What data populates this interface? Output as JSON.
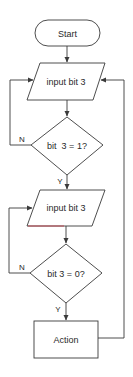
{
  "diagram": {
    "type": "flowchart",
    "colors": {
      "stroke": "#3a3a3a",
      "text": "#2a2a2a",
      "background": "#ffffff",
      "accent_edge": "#c0404a"
    },
    "nodes": {
      "start": {
        "shape": "terminal",
        "label": "Start"
      },
      "input1": {
        "shape": "parallelogram",
        "label": "input bit 3"
      },
      "decision1": {
        "shape": "diamond",
        "label": "bit  3 = 1?"
      },
      "input2": {
        "shape": "parallelogram",
        "label": "input bit 3"
      },
      "decision2": {
        "shape": "diamond",
        "label": "bit 3 = 0?"
      },
      "action": {
        "shape": "rectangle",
        "label": "Action"
      }
    },
    "edges": [
      {
        "from": "start",
        "to": "input1",
        "label": ""
      },
      {
        "from": "input1",
        "to": "decision1",
        "label": ""
      },
      {
        "from": "decision1",
        "to": "input1",
        "label": "N"
      },
      {
        "from": "decision1",
        "to": "input2",
        "label": "Y"
      },
      {
        "from": "input2",
        "to": "decision2",
        "label": ""
      },
      {
        "from": "decision2",
        "to": "input2",
        "label": "N"
      },
      {
        "from": "decision2",
        "to": "action",
        "label": "Y"
      },
      {
        "from": "action",
        "to": "input1",
        "label": ""
      }
    ],
    "edge_labels": {
      "d1_no": "N",
      "d1_yes": "Y",
      "d2_no": "N",
      "d2_yes": "Y"
    }
  }
}
